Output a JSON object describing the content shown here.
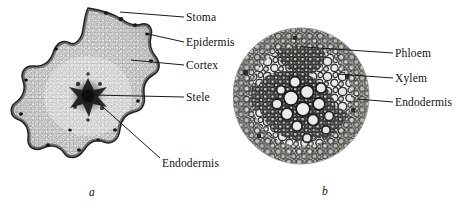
{
  "figure": {
    "background_color": "#ffffff",
    "width": 461,
    "height": 208,
    "kind": "botanical-micrograph-figure"
  },
  "panels": [
    {
      "id": "a",
      "letter": "a",
      "specimen": "stem cross-section, lobed outline with central stele",
      "shape": "lobed-star",
      "labels": [
        {
          "key": "stoma",
          "text": "Stoma",
          "x": 186,
          "y": 20,
          "leader": {
            "x1": 184,
            "y1": 20,
            "x2": 120,
            "y2": 15
          }
        },
        {
          "key": "epidermis",
          "text": "Epidermis",
          "x": 186,
          "y": 45,
          "leader": {
            "x1": 184,
            "y1": 45,
            "x2": 148,
            "y2": 37
          }
        },
        {
          "key": "cortex",
          "text": "Cortex",
          "x": 186,
          "y": 68,
          "leader": {
            "x1": 184,
            "y1": 68,
            "x2": 131,
            "y2": 63
          }
        },
        {
          "key": "stele",
          "text": "Stele",
          "x": 186,
          "y": 100,
          "leader": {
            "x1": 184,
            "y1": 100,
            "x2": 93,
            "y2": 96
          }
        },
        {
          "key": "endodermis",
          "text": "Endodermis",
          "x": 162,
          "y": 164,
          "leader": {
            "x1": 160,
            "y1": 160,
            "x2": 94,
            "y2": 101
          }
        }
      ]
    },
    {
      "id": "b",
      "letter": "b",
      "specimen": "stele cross-section, circular field showing vascular tissue",
      "shape": "circle",
      "labels": [
        {
          "key": "phloem",
          "text": "Phloem",
          "x": 395,
          "y": 56,
          "leader": {
            "x1": 393,
            "y1": 56,
            "x2": 304,
            "y2": 50
          }
        },
        {
          "key": "xylem",
          "text": "Xylem",
          "x": 395,
          "y": 81,
          "leader": {
            "x1": 393,
            "y1": 81,
            "x2": 337,
            "y2": 77
          }
        },
        {
          "key": "endodermis",
          "text": "Endodermis",
          "x": 395,
          "y": 105,
          "leader": {
            "x1": 393,
            "y1": 105,
            "x2": 357,
            "y2": 102
          }
        }
      ]
    }
  ],
  "colors": {
    "ink": "#101010",
    "leader_line": "#1a1a1a",
    "tissue_light": "#e9e9e7",
    "tissue_mid": "#9a9a96",
    "tissue_dark": "#2b2b2b"
  }
}
